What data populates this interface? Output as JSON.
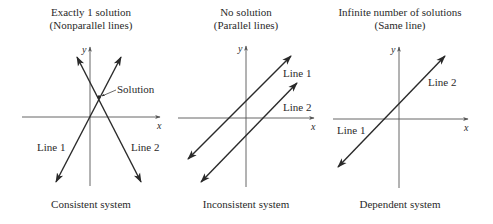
{
  "colors": {
    "line": "#2a2a2a",
    "axis": "#555555",
    "text": "#2a2a2a",
    "background": "#ffffff"
  },
  "panels": [
    {
      "title_line1": "Exactly 1 solution",
      "title_line2": "(Nonparallel lines)",
      "caption": "Consistent system",
      "x_axis_label": "x",
      "y_axis_label": "y",
      "line1_label": "Line 1",
      "line2_label": "Line 2",
      "annotation": "Solution"
    },
    {
      "title_line1": "No solution",
      "title_line2": "(Parallel lines)",
      "caption": "Inconsistent system",
      "x_axis_label": "x",
      "y_axis_label": "y",
      "line1_label": "Line 1",
      "line2_label": "Line 2"
    },
    {
      "title_line1": "Infinite number of solutions",
      "title_line2": "(Same line)",
      "caption": "Dependent system",
      "x_axis_label": "x",
      "y_axis_label": "y",
      "line1_label": "Line 1",
      "line2_label": "Line 2"
    }
  ]
}
